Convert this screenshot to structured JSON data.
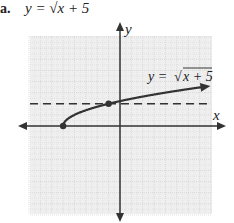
{
  "problem": {
    "label": "a.",
    "equation": "y = √x + 5"
  },
  "chart_data": {
    "type": "line",
    "xlabel": "x",
    "ylabel": "y",
    "xlim": [
      -8,
      8
    ],
    "ylim": [
      -8,
      8
    ],
    "grid": true,
    "series": [
      {
        "name": "y = √(x + 5)",
        "x": [
          -5,
          -4,
          -1,
          0,
          4,
          8
        ],
        "y": [
          0,
          1,
          2,
          2.236,
          3,
          3.606
        ],
        "arrow_end": true,
        "color": "#333333"
      }
    ],
    "points": [
      {
        "x": -5,
        "y": 0
      },
      {
        "x": -1,
        "y": 2
      }
    ],
    "reference_lines": [
      {
        "type": "horizontal",
        "y": 2,
        "style": "dashed",
        "color": "#333333"
      }
    ],
    "annotations": [
      {
        "text": "y = √x + 5",
        "x": 3,
        "y": 4.3
      }
    ]
  },
  "labels": {
    "x_axis": "x",
    "y_axis": "y",
    "curve": "y = √x + 5"
  },
  "colors": {
    "grid_fill": "#efefef",
    "grid_line": "#c8c8c8",
    "axis": "#333333",
    "curve": "#333333"
  }
}
